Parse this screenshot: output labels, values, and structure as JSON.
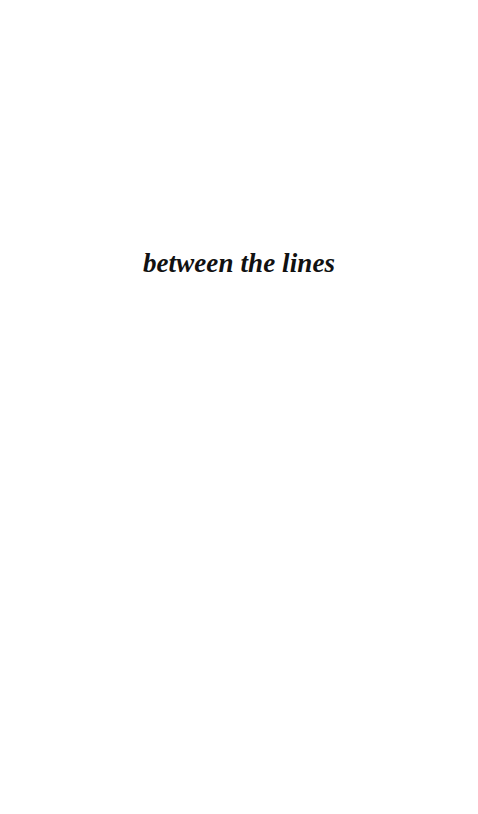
{
  "document": {
    "page_background_color": "#ffffff",
    "text_color": "#111111",
    "body": {
      "section_title": "between the lines"
    }
  }
}
